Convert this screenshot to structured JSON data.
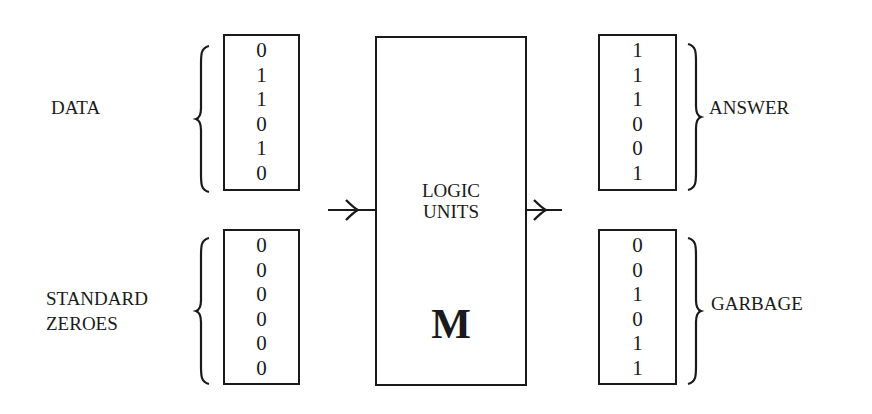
{
  "diagram": {
    "inputs": {
      "data": {
        "label": "DATA",
        "bits": [
          "0",
          "1",
          "1",
          "0",
          "1",
          "0"
        ]
      },
      "standard_zeroes": {
        "label_line1": "STANDARD",
        "label_line2": "ZEROES",
        "bits": [
          "0",
          "0",
          "0",
          "0",
          "0",
          "0"
        ]
      }
    },
    "logic_unit": {
      "title_line1": "LOGIC",
      "title_line2": "UNITS",
      "symbol": "M"
    },
    "outputs": {
      "answer": {
        "label": "ANSWER",
        "bits": [
          "1",
          "1",
          "1",
          "0",
          "0",
          "1"
        ]
      },
      "garbage": {
        "label": "GARBAGE",
        "bits": [
          "0",
          "0",
          "1",
          "0",
          "1",
          "1"
        ]
      }
    },
    "colors": {
      "ink": "#1a1a1a",
      "background": "#ffffff"
    }
  }
}
